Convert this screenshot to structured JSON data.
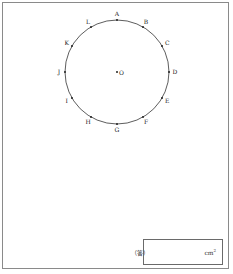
{
  "figure": {
    "center": {
      "label": "O",
      "cx": 117,
      "cy": 72
    },
    "radius": 52,
    "points": [
      {
        "label": "A",
        "angle": 90
      },
      {
        "label": "B",
        "angle": 60
      },
      {
        "label": "C",
        "angle": 30
      },
      {
        "label": "D",
        "angle": 0
      },
      {
        "label": "E",
        "angle": -30
      },
      {
        "label": "F",
        "angle": -60
      },
      {
        "label": "G",
        "angle": -90
      },
      {
        "label": "H",
        "angle": -120
      },
      {
        "label": "I",
        "angle": -150
      },
      {
        "label": "J",
        "angle": 180
      },
      {
        "label": "K",
        "angle": 150
      },
      {
        "label": "L",
        "angle": 120
      }
    ],
    "stroke_color": "#333333"
  },
  "answer": {
    "label": "（答）",
    "value": "",
    "unit": "cm",
    "unit_exp": "2"
  }
}
